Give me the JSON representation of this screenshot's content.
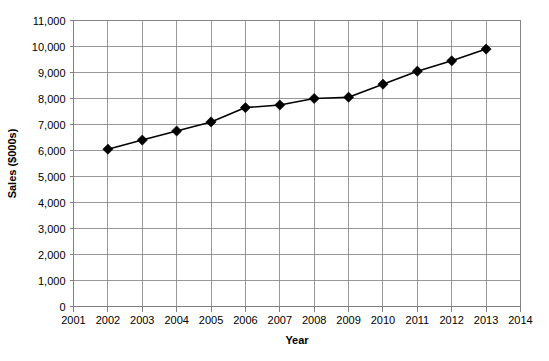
{
  "chart_data": {
    "type": "line",
    "title": "",
    "xlabel": "Year",
    "ylabel": "Sales ($000s)",
    "x": [
      2002,
      2003,
      2004,
      2005,
      2006,
      2007,
      2008,
      2009,
      2010,
      2011,
      2012,
      2013
    ],
    "values": [
      6050,
      6400,
      6750,
      7100,
      7650,
      7750,
      8000,
      8050,
      8550,
      9050,
      9450,
      9900
    ],
    "series": [
      {
        "name": "Sales",
        "values": [
          6050,
          6400,
          6750,
          7100,
          7650,
          7750,
          8000,
          8050,
          8550,
          9050,
          9450,
          9900
        ]
      }
    ],
    "xlim": [
      2001,
      2014
    ],
    "ylim": [
      0,
      11000
    ],
    "x_tick_labels": [
      "2001",
      "2002",
      "2003",
      "2004",
      "2005",
      "2006",
      "2007",
      "2008",
      "2009",
      "2010",
      "2011",
      "2012",
      "2013",
      "2014"
    ],
    "x_tick_values": [
      2001,
      2002,
      2003,
      2004,
      2005,
      2006,
      2007,
      2008,
      2009,
      2010,
      2011,
      2012,
      2013,
      2014
    ],
    "y_tick_labels": [
      "0",
      "1,000",
      "2,000",
      "3,000",
      "4,000",
      "5,000",
      "6,000",
      "7,000",
      "8,000",
      "9,000",
      "10,000",
      "11,000"
    ],
    "y_tick_values": [
      0,
      1000,
      2000,
      3000,
      4000,
      5000,
      6000,
      7000,
      8000,
      9000,
      10000,
      11000
    ],
    "grid": {
      "horizontal": true,
      "vertical": true
    },
    "legend": {
      "visible": false,
      "position": "none"
    },
    "marker": "diamond",
    "line_color": "#000000",
    "grid_color": "#808080",
    "background_color": "#FFFFFF"
  }
}
